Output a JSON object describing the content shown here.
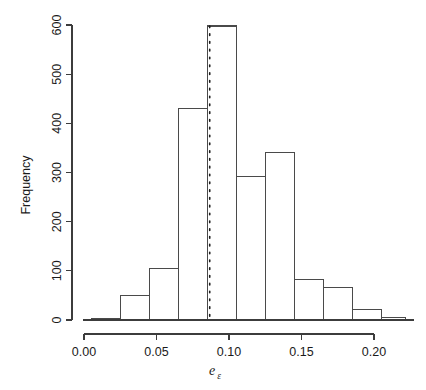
{
  "chart_data": {
    "type": "bar",
    "title": "",
    "subtitle": "",
    "xlabel": "e_epsilon",
    "xlabel_base": "e",
    "xlabel_subscript": "ε",
    "ylabel": "Frequency",
    "xlim": [
      -0.004,
      0.224
    ],
    "ylim": [
      0,
      620
    ],
    "grid": false,
    "legend": null,
    "bin_width": 0.02,
    "x_ticks": [
      0.0,
      0.05,
      0.1,
      0.15,
      0.2
    ],
    "x_tick_labels": [
      "0.00",
      "0.05",
      "0.10",
      "0.15",
      "0.20"
    ],
    "y_ticks": [
      0,
      100,
      200,
      300,
      400,
      500,
      600
    ],
    "y_tick_labels": [
      "0",
      "100",
      "200",
      "300",
      "400",
      "500",
      "600"
    ],
    "bins": [
      {
        "left": 0.005,
        "right": 0.025,
        "value": 3
      },
      {
        "left": 0.025,
        "right": 0.045,
        "value": 49
      },
      {
        "left": 0.045,
        "right": 0.065,
        "value": 104
      },
      {
        "left": 0.065,
        "right": 0.085,
        "value": 431
      },
      {
        "left": 0.085,
        "right": 0.105,
        "value": 598
      },
      {
        "left": 0.105,
        "right": 0.125,
        "value": 292
      },
      {
        "left": 0.125,
        "right": 0.145,
        "value": 340
      },
      {
        "left": 0.145,
        "right": 0.165,
        "value": 83
      },
      {
        "left": 0.165,
        "right": 0.185,
        "value": 67
      },
      {
        "left": 0.185,
        "right": 0.205,
        "value": 22
      },
      {
        "left": 0.205,
        "right": 0.222,
        "value": 5
      }
    ],
    "categories": [
      "0.005-0.025",
      "0.025-0.045",
      "0.045-0.065",
      "0.065-0.085",
      "0.085-0.105",
      "0.105-0.125",
      "0.125-0.145",
      "0.145-0.165",
      "0.165-0.185",
      "0.185-0.205",
      "0.205-0.222"
    ],
    "values": [
      3,
      49,
      104,
      431,
      598,
      292,
      340,
      83,
      67,
      22,
      5
    ],
    "annotations": [
      {
        "name": "reference-line",
        "type": "vertical-dotted-line",
        "x": 0.0867,
        "style": "dotted",
        "color": "#1c1c1c"
      }
    ],
    "colors": {
      "bar_stroke": "#4a4a4a",
      "bar_fill": "none",
      "axis": "#3c3c3c",
      "vline": "#1c1c1c",
      "background": "#ffffff"
    }
  },
  "figure": {
    "background": "#ffffff"
  }
}
